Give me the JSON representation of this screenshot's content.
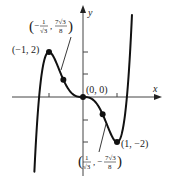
{
  "figure": {
    "axes": {
      "x_label": "x",
      "y_label": "y",
      "origin_label": "(0, 0)"
    },
    "points": {
      "local_max": {
        "label": "(−1, 2)",
        "x": -1,
        "y": 2
      },
      "inflection_left": {
        "label_x_num": "1",
        "label_x_den": "√3",
        "label_y_num": "7√3",
        "label_y_den": "8",
        "x": -0.577,
        "y": 1.516,
        "sign_x": "−",
        "sign_y": ""
      },
      "origin": {
        "label": "(0, 0)",
        "x": 0,
        "y": 0
      },
      "inflection_right": {
        "label_x_num": "1",
        "label_x_den": "√3",
        "label_y_num": "7√3",
        "label_y_den": "8",
        "x": 0.577,
        "y": -1.516,
        "sign_x": "",
        "sign_y": "−"
      },
      "local_min": {
        "label": "(1, −2)",
        "x": 1,
        "y": -2
      }
    },
    "colors": {
      "curve": "#111111",
      "axis": "#444444",
      "text": "#1a1a1a"
    }
  },
  "chart_data": {
    "type": "line",
    "title": "",
    "xlabel": "x",
    "ylabel": "y",
    "function": "y = 3x^5 - 5x^3",
    "series": [
      {
        "name": "curve",
        "x": [
          -1.45,
          -1.3,
          -1.2,
          -1.1,
          -1.0,
          -0.9,
          -0.8,
          -0.7,
          -0.577,
          -0.5,
          -0.4,
          -0.3,
          -0.2,
          -0.1,
          0,
          0.1,
          0.2,
          0.3,
          0.4,
          0.5,
          0.577,
          0.7,
          0.8,
          0.9,
          1.0,
          1.1,
          1.2,
          1.3,
          1.45
        ],
        "y": [
          -2.93,
          -0.16,
          1.18,
          1.83,
          2.0,
          1.87,
          1.58,
          1.21,
          1.516,
          0.53,
          0.29,
          0.13,
          0.04,
          0.005,
          0,
          -0.005,
          -0.04,
          -0.13,
          -0.29,
          -0.53,
          -1.516,
          -1.21,
          -1.58,
          -1.87,
          -2.0,
          -1.83,
          -1.18,
          0.16,
          2.93
        ]
      }
    ],
    "marked_points": [
      {
        "label": "(-1, 2)",
        "x": -1,
        "y": 2
      },
      {
        "label": "(-1/√3, 7√3/8)",
        "x": -0.577,
        "y": 1.516
      },
      {
        "label": "(0, 0)",
        "x": 0,
        "y": 0
      },
      {
        "label": "(1/√3, -7√3/8)",
        "x": 0.577,
        "y": -1.516
      },
      {
        "label": "(1, -2)",
        "x": 1,
        "y": -2
      }
    ],
    "x_ticks": [
      -1,
      1
    ],
    "y_ticks": [
      -2,
      -1,
      1,
      2
    ],
    "xlim": [
      -2.1,
      2.5
    ],
    "ylim": [
      -3.8,
      4.0
    ],
    "grid": false,
    "legend": "none"
  }
}
